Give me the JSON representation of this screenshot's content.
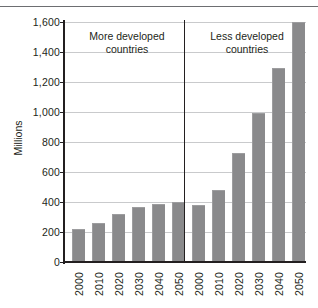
{
  "chart_data": {
    "type": "bar",
    "title": "",
    "xlabel": "",
    "ylabel": "Millions",
    "ylim": [
      0,
      1600
    ],
    "yticks": [
      0,
      200,
      400,
      600,
      800,
      1000,
      1200,
      1400,
      1600
    ],
    "ytick_labels": [
      "0",
      "200",
      "400",
      "600",
      "800",
      "1,000",
      "1,200",
      "1,400",
      "1,600"
    ],
    "grid": true,
    "legend": "none",
    "bar_color": "#8a8a8c",
    "categories": [
      "2000",
      "2010",
      "2020",
      "2030",
      "2040",
      "2050"
    ],
    "groups": [
      {
        "name": "More developed countries",
        "annotation": "More developed\ncountries",
        "annotation_line1": "More developed",
        "annotation_line2": "countries",
        "categories": [
          "2000",
          "2010",
          "2020",
          "2030",
          "2040",
          "2050"
        ],
        "values": [
          220,
          260,
          320,
          370,
          390,
          400
        ]
      },
      {
        "name": "Less developed countries",
        "annotation": "Less developed\ncountries",
        "annotation_line1": "Less developed",
        "annotation_line2": "countries",
        "categories": [
          "2000",
          "2010",
          "2020",
          "2030",
          "2040",
          "2050"
        ],
        "values": [
          380,
          480,
          725,
          995,
          1295,
          1600
        ]
      }
    ],
    "series": [
      {
        "name": "More developed countries",
        "values": [
          220,
          260,
          320,
          370,
          390,
          400
        ]
      },
      {
        "name": "Less developed countries",
        "values": [
          380,
          480,
          725,
          995,
          1295,
          1600
        ]
      }
    ]
  },
  "axis": {
    "y_title": "Millions",
    "y_tick_labels": [
      "1,600",
      "1,400",
      "1,200",
      "1,000",
      "800",
      "600",
      "400",
      "200",
      "0"
    ],
    "x_tick_labels": [
      "2000",
      "2010",
      "2020",
      "2030",
      "2040",
      "2050",
      "2000",
      "2010",
      "2020",
      "2030",
      "2040",
      "2050"
    ]
  },
  "annotations": {
    "group0_line1": "More developed",
    "group0_line2": "countries",
    "group1_line1": "Less developed",
    "group1_line2": "countries"
  }
}
